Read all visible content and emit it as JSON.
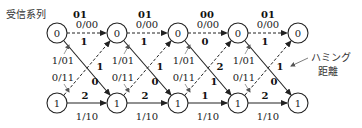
{
  "title": "受信系列",
  "received_sequence": [
    "01",
    "01",
    "00",
    "01"
  ],
  "annotation": {
    "line1": "ハミング",
    "line2": "距離"
  },
  "state_labels": {
    "top": "0",
    "bottom": "1"
  },
  "branch_labels": {
    "top_horizontal": "0/00",
    "bottom_horizontal": "1/10",
    "bottom_to_top": "1/01",
    "top_to_bottom": "0/11"
  },
  "hamming": {
    "top_horizontal": [
      "1",
      "1",
      "0",
      "1"
    ],
    "bottom_horizontal": [
      "2",
      "2",
      "1",
      "2"
    ],
    "top_to_bottom": [
      "0",
      "0",
      "1",
      "0"
    ],
    "bottom_to_top": [
      "1",
      "1",
      "2",
      "1"
    ]
  },
  "nodes": {
    "top": [
      "0",
      "0",
      "0",
      "0",
      "0"
    ],
    "bottom": [
      "1",
      "1",
      "1",
      "1",
      "1"
    ]
  }
}
